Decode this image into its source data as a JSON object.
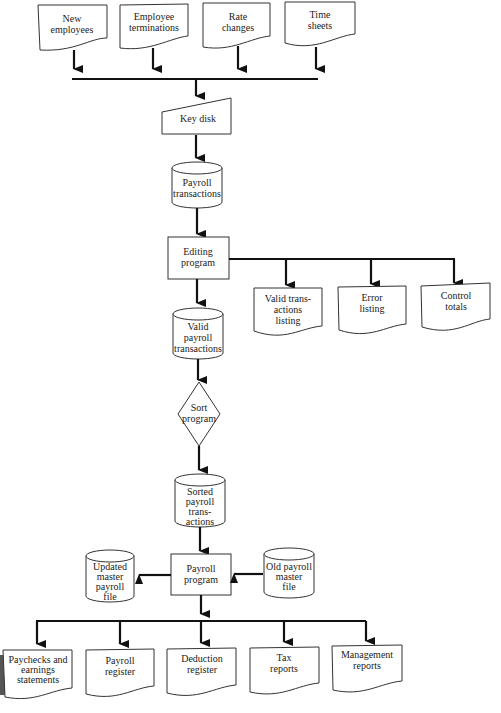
{
  "diagram": {
    "type": "system-flowchart",
    "inputs": [
      {
        "id": "new-employees",
        "lines": [
          "New",
          "employees"
        ]
      },
      {
        "id": "employee-terminations",
        "lines": [
          "Employee",
          "terminations"
        ]
      },
      {
        "id": "rate-changes",
        "lines": [
          "Rate",
          "changes"
        ]
      },
      {
        "id": "time-sheets",
        "lines": [
          "Time",
          "sheets"
        ]
      }
    ],
    "key_disk": {
      "lines": [
        "Key disk"
      ]
    },
    "payroll_transactions": {
      "lines": [
        "Payroll",
        "transactions"
      ]
    },
    "editing_program": {
      "lines": [
        "Editing",
        "program"
      ]
    },
    "editing_outputs": [
      {
        "id": "valid-transactions-listing",
        "lines": [
          "Valid trans-",
          "actions",
          "listing"
        ]
      },
      {
        "id": "error-listing",
        "lines": [
          "Error",
          "listing"
        ]
      },
      {
        "id": "control-totals",
        "lines": [
          "Control",
          "totals"
        ]
      }
    ],
    "valid_payroll_transactions": {
      "lines": [
        "Valid",
        "payroll",
        "transactions"
      ]
    },
    "sort_program": {
      "lines": [
        "Sort",
        "program"
      ]
    },
    "sorted_payroll_transactions": {
      "lines": [
        "Sorted",
        "payroll",
        "trans-",
        "actions"
      ]
    },
    "payroll_program": {
      "lines": [
        "Payroll",
        "program"
      ]
    },
    "updated_master": {
      "lines": [
        "Updated",
        "master",
        "payroll",
        "file"
      ]
    },
    "old_master": {
      "lines": [
        "Old payroll",
        "master",
        "file"
      ]
    },
    "reports": [
      {
        "id": "paychecks",
        "lines": [
          "Paychecks and",
          "earnings",
          "statements"
        ]
      },
      {
        "id": "payroll-register",
        "lines": [
          "Payroll",
          "register"
        ]
      },
      {
        "id": "deduction-register",
        "lines": [
          "Deduction",
          "register"
        ]
      },
      {
        "id": "tax-reports",
        "lines": [
          "Tax",
          "reports"
        ]
      },
      {
        "id": "management-reports",
        "lines": [
          "Management",
          "reports"
        ]
      }
    ]
  }
}
